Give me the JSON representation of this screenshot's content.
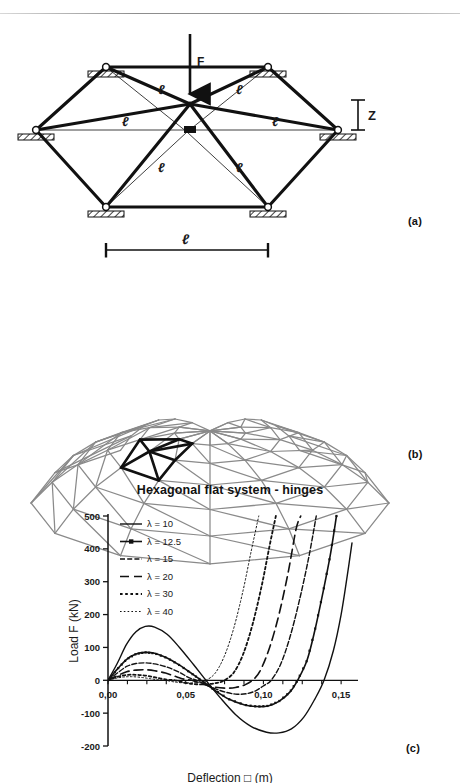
{
  "figure_a": {
    "name": "hexagonal-flat-truss-system",
    "load_label": "F",
    "height_label": "Z",
    "member_labels": [
      "ℓ",
      "ℓ",
      "ℓ",
      "ℓ",
      "ℓ",
      "ℓ"
    ],
    "span_label": "ℓ",
    "panel_label": "(a)"
  },
  "figure_b": {
    "name": "geodesic-dome-mesh",
    "panel_label": "(b)",
    "highlight": "hexagonal unit",
    "mesh_color": "#8a8a8a",
    "highlight_color": "#111111"
  },
  "figure_c": {
    "panel_label": "(c)"
  },
  "chart_data": {
    "type": "line",
    "title": "Hexagonal flat system - hinges",
    "xlabel": "Deflection □ (m)",
    "ylabel": "Load F (kN)",
    "xlim": [
      0.0,
      0.157
    ],
    "ylim": [
      -200,
      500
    ],
    "xticks": [
      0.0,
      0.05,
      0.1,
      0.15
    ],
    "xticklabels": [
      "0,00",
      "0,05",
      "0,10",
      "0,15"
    ],
    "yticks": [
      -200,
      -100,
      0,
      100,
      200,
      300,
      400,
      500
    ],
    "yticklabels": [
      "-200",
      "-100",
      "0",
      "100",
      "200",
      "300",
      "400",
      "500"
    ],
    "grid": false,
    "legend_position": "top-left inside",
    "legend_title": "",
    "series": [
      {
        "name": "λ = 10",
        "style": "solid",
        "linewidth": 1.4,
        "markers": false,
        "points": [
          [
            0.0,
            0
          ],
          [
            0.006,
            52
          ],
          [
            0.012,
            110
          ],
          [
            0.018,
            148
          ],
          [
            0.024,
            164
          ],
          [
            0.03,
            162
          ],
          [
            0.038,
            140
          ],
          [
            0.046,
            100
          ],
          [
            0.055,
            48
          ],
          [
            0.063,
            0
          ],
          [
            0.072,
            -52
          ],
          [
            0.082,
            -104
          ],
          [
            0.092,
            -140
          ],
          [
            0.102,
            -158
          ],
          [
            0.11,
            -160
          ],
          [
            0.118,
            -148
          ],
          [
            0.126,
            -112
          ],
          [
            0.133,
            -58
          ],
          [
            0.139,
            0
          ],
          [
            0.145,
            90
          ],
          [
            0.15,
            200
          ],
          [
            0.154,
            320
          ],
          [
            0.157,
            418
          ]
        ]
      },
      {
        "name": "λ = 12.5",
        "style": "solid-marker",
        "linewidth": 1.6,
        "markers": true,
        "points": [
          [
            0.0,
            0
          ],
          [
            0.006,
            34
          ],
          [
            0.012,
            64
          ],
          [
            0.018,
            80
          ],
          [
            0.024,
            85
          ],
          [
            0.03,
            82
          ],
          [
            0.038,
            68
          ],
          [
            0.046,
            46
          ],
          [
            0.054,
            20
          ],
          [
            0.06,
            0
          ],
          [
            0.068,
            -28
          ],
          [
            0.078,
            -58
          ],
          [
            0.088,
            -75
          ],
          [
            0.096,
            -80
          ],
          [
            0.103,
            -78
          ],
          [
            0.11,
            -64
          ],
          [
            0.117,
            -36
          ],
          [
            0.122,
            0
          ],
          [
            0.128,
            60
          ],
          [
            0.133,
            150
          ],
          [
            0.138,
            260
          ],
          [
            0.143,
            380
          ],
          [
            0.147,
            500
          ]
        ]
      },
      {
        "name": "λ = 15",
        "style": "dash-dot-fine",
        "linewidth": 1.4,
        "markers": false,
        "points": [
          [
            0.0,
            0
          ],
          [
            0.006,
            22
          ],
          [
            0.012,
            42
          ],
          [
            0.018,
            51
          ],
          [
            0.024,
            53
          ],
          [
            0.03,
            50
          ],
          [
            0.038,
            40
          ],
          [
            0.046,
            24
          ],
          [
            0.052,
            8
          ],
          [
            0.057,
            0
          ],
          [
            0.065,
            -18
          ],
          [
            0.074,
            -34
          ],
          [
            0.082,
            -42
          ],
          [
            0.089,
            -41
          ],
          [
            0.095,
            -32
          ],
          [
            0.101,
            -14
          ],
          [
            0.105,
            0
          ],
          [
            0.111,
            48
          ],
          [
            0.117,
            130
          ],
          [
            0.123,
            240
          ],
          [
            0.129,
            370
          ],
          [
            0.134,
            500
          ]
        ]
      },
      {
        "name": "λ = 20",
        "style": "dashed",
        "linewidth": 1.6,
        "markers": false,
        "points": [
          [
            0.0,
            0
          ],
          [
            0.006,
            14
          ],
          [
            0.012,
            26
          ],
          [
            0.018,
            31
          ],
          [
            0.024,
            32
          ],
          [
            0.03,
            29
          ],
          [
            0.037,
            22
          ],
          [
            0.044,
            11
          ],
          [
            0.05,
            2
          ],
          [
            0.054,
            0
          ],
          [
            0.061,
            -12
          ],
          [
            0.069,
            -21
          ],
          [
            0.076,
            -24
          ],
          [
            0.082,
            -22
          ],
          [
            0.088,
            -14
          ],
          [
            0.093,
            0
          ],
          [
            0.098,
            30
          ],
          [
            0.104,
            100
          ],
          [
            0.11,
            200
          ],
          [
            0.116,
            330
          ],
          [
            0.121,
            460
          ],
          [
            0.124,
            500
          ]
        ]
      },
      {
        "name": "λ = 30",
        "style": "dotted-thick",
        "linewidth": 1.8,
        "markers": false,
        "points": [
          [
            0.0,
            0
          ],
          [
            0.005,
            9
          ],
          [
            0.01,
            15
          ],
          [
            0.015,
            17
          ],
          [
            0.02,
            16
          ],
          [
            0.026,
            13
          ],
          [
            0.032,
            7
          ],
          [
            0.038,
            2
          ],
          [
            0.043,
            0
          ],
          [
            0.05,
            -8
          ],
          [
            0.057,
            -12
          ],
          [
            0.064,
            -12
          ],
          [
            0.07,
            -8
          ],
          [
            0.075,
            0
          ],
          [
            0.081,
            24
          ],
          [
            0.087,
            80
          ],
          [
            0.093,
            170
          ],
          [
            0.099,
            290
          ],
          [
            0.104,
            410
          ],
          [
            0.108,
            500
          ]
        ]
      },
      {
        "name": "λ = 40",
        "style": "dotted-fine",
        "linewidth": 1.0,
        "markers": false,
        "points": [
          [
            0.0,
            0
          ],
          [
            0.005,
            6
          ],
          [
            0.01,
            10
          ],
          [
            0.015,
            11
          ],
          [
            0.021,
            9
          ],
          [
            0.027,
            5
          ],
          [
            0.033,
            1
          ],
          [
            0.037,
            0
          ],
          [
            0.044,
            -6
          ],
          [
            0.051,
            -8
          ],
          [
            0.058,
            -6
          ],
          [
            0.063,
            0
          ],
          [
            0.069,
            22
          ],
          [
            0.075,
            75
          ],
          [
            0.081,
            160
          ],
          [
            0.087,
            275
          ],
          [
            0.092,
            390
          ],
          [
            0.097,
            500
          ]
        ]
      }
    ]
  }
}
